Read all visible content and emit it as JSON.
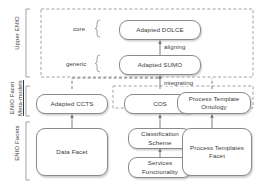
{
  "diagram": {
    "stroke_color": "#8a8a8a",
    "text_color": "#3c3c3c",
    "background": "#ffffff",
    "layers": [
      {
        "id": "upper",
        "label": "Upper ENIO"
      },
      {
        "id": "meta",
        "label_line1": "ENIO Facet",
        "label_line2": "Meta-models"
      },
      {
        "id": "facets",
        "label": "ENIO Facets"
      }
    ],
    "brace_labels": [
      {
        "id": "core",
        "label": "core"
      },
      {
        "id": "generic",
        "label": "generic"
      }
    ],
    "nodes": [
      {
        "id": "adapted-dolce",
        "label": "Adapted DOLCE"
      },
      {
        "id": "adapted-sumo",
        "label": "Adapted SUMO"
      },
      {
        "id": "adapted-ccts",
        "label": "Adapted CCTS"
      },
      {
        "id": "cos",
        "label": "COS"
      },
      {
        "id": "process-template-ontology",
        "label_line1": "Process Template",
        "label_line2": "Ontology"
      },
      {
        "id": "data-facet",
        "label": "Data Facet"
      },
      {
        "id": "classification-scheme",
        "label_line1": "Classification",
        "label_line2": "Scheme"
      },
      {
        "id": "services-functionality",
        "label_line1": "Services",
        "label_line2": "Functionality"
      },
      {
        "id": "process-templates-facet",
        "label_line1": "Process Templates",
        "label_line2": "Facet"
      }
    ],
    "edge_labels": [
      {
        "id": "aligning",
        "label": "aligning"
      },
      {
        "id": "integrating",
        "label": "integrating"
      }
    ]
  }
}
